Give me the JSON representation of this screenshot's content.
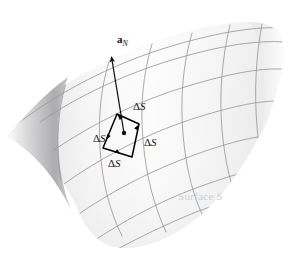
{
  "figure": {
    "canvas": {
      "width": 295,
      "height": 257,
      "background": "#ffffff"
    }
  },
  "colors": {
    "surface_light": "#fbfbfb",
    "surface_mid": "#ececed",
    "surface_shadow": "#b9b9ba",
    "gridline": "#9a9a9c",
    "patch_outline": "#000000",
    "vector": "#111111",
    "surface_text": "#cfcfcf",
    "label_text": "#161616"
  },
  "labels": {
    "normal_vector": {
      "symbol": "a",
      "subscript": "N",
      "text": "a_N"
    },
    "delta_s": "S",
    "delta_glyph": "Δ",
    "surface_caption_prefix": "Surface ",
    "surface_caption_symbol": "S"
  },
  "delta_labels": [
    {
      "id": "inside-patch",
      "text": "S",
      "x": 97,
      "y": 140
    },
    {
      "id": "upper-right",
      "text": "S",
      "x": 136,
      "y": 108
    },
    {
      "id": "mid-right",
      "text": "S",
      "x": 148,
      "y": 144
    },
    {
      "id": "below-patch",
      "text": "S",
      "x": 112,
      "y": 163
    }
  ],
  "surface_caption": {
    "text": "Surface S",
    "x": 180,
    "y": 192
  },
  "vector_label_pos": {
    "x": 119,
    "y": 40
  },
  "geometry": {
    "normal_arrow": {
      "from_x": 124,
      "from_y": 133,
      "to_x": 111,
      "to_y": 55
    },
    "patch_center_dot": {
      "x": 124,
      "y": 133,
      "r": 2.2
    },
    "patch_corners": [
      {
        "x": 117,
        "y": 114
      },
      {
        "x": 139,
        "y": 124
      },
      {
        "x": 132,
        "y": 157
      },
      {
        "x": 103,
        "y": 148
      }
    ],
    "grid_columns": 6,
    "grid_rows": 4
  }
}
